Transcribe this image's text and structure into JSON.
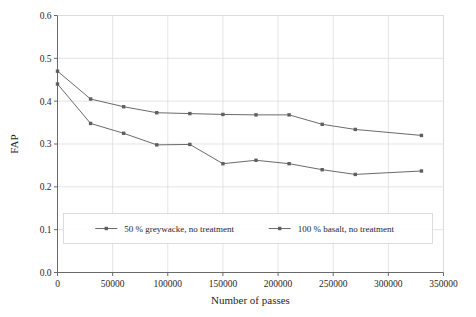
{
  "chart_data": {
    "type": "line",
    "title": "",
    "xlabel": "Number of passes",
    "ylabel": "FAP",
    "xlim": [
      0,
      350000
    ],
    "ylim": [
      0.0,
      0.6
    ],
    "xticks": [
      0,
      50000,
      100000,
      150000,
      200000,
      250000,
      300000,
      350000
    ],
    "xtick_labels": [
      "0",
      "50000",
      "100000",
      "150000",
      "200000",
      "250000",
      "300000",
      "350000"
    ],
    "yticks": [
      0.0,
      0.1,
      0.2,
      0.3,
      0.4,
      0.5,
      0.6
    ],
    "ytick_labels": [
      "0.0",
      "0.1",
      "0.2",
      "0.3",
      "0.4",
      "0.5",
      "0.6"
    ],
    "grid": true,
    "grid_axes": "both",
    "legend_position": "lower-center-inside",
    "marker": "square",
    "line_color": "#6b6b6b",
    "marker_color": "#5f5f5f",
    "series": [
      {
        "name": "50 % greywacke, no treatment",
        "x": [
          0,
          30000,
          60000,
          90000,
          120000,
          150000,
          180000,
          210000,
          240000,
          270000,
          330000
        ],
        "values": [
          0.47,
          0.405,
          0.387,
          0.373,
          0.371,
          0.369,
          0.368,
          0.368,
          0.346,
          0.334,
          0.32
        ]
      },
      {
        "name": "100 % basalt, no treatment",
        "x": [
          0,
          30000,
          60000,
          90000,
          120000,
          150000,
          180000,
          210000,
          240000,
          270000,
          330000
        ],
        "values": [
          0.44,
          0.348,
          0.325,
          0.298,
          0.299,
          0.254,
          0.262,
          0.254,
          0.24,
          0.229,
          0.237
        ]
      }
    ]
  },
  "legend": {
    "entries": [
      {
        "label": "50 % greywacke, no treatment"
      },
      {
        "label": "100 % basalt, no treatment"
      }
    ]
  }
}
